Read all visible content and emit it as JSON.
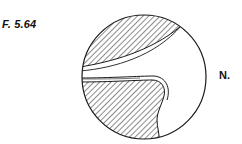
{
  "figure": {
    "label": "F. 5.64",
    "side_label": "N.",
    "stroke_color": "#1a1a1a",
    "background": "#ffffff"
  }
}
